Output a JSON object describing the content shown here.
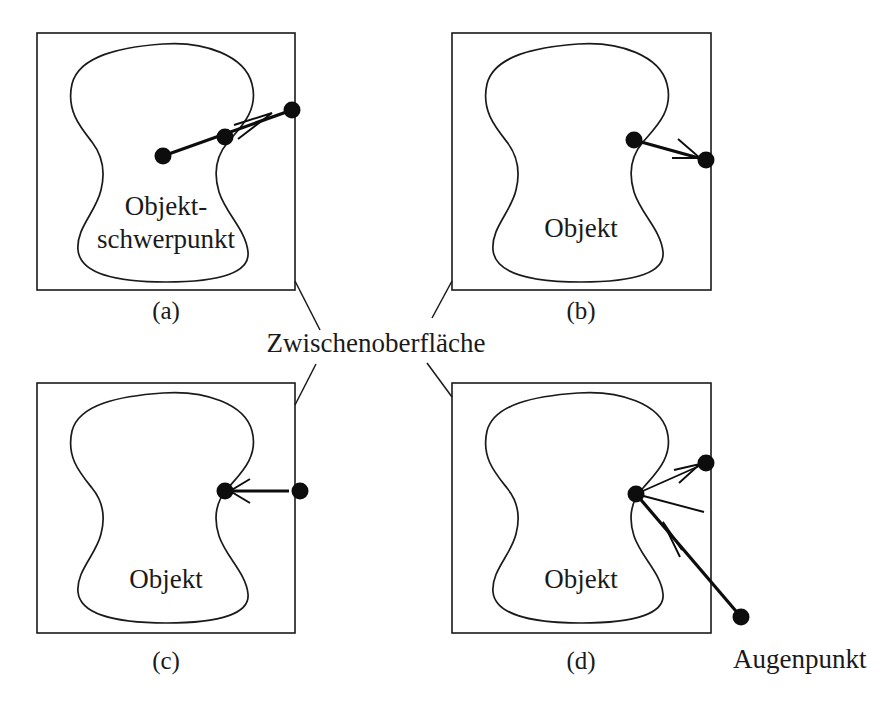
{
  "figure": {
    "caption_fragment_top": "",
    "callout_label": "Zwischenoberfläche",
    "eye_point_label": "Augenpunkt",
    "ink_color": "#1a1a1a",
    "background_color": "#ffffff"
  },
  "panels": [
    {
      "id": "a",
      "label": "(a)",
      "blob_label_line1": "Objekt-",
      "blob_label_line2": "schwerpunkt",
      "description": "Strahl vom Objektschwerpunkt durch Oberflächenpunkt nach außen"
    },
    {
      "id": "b",
      "label": "(b)",
      "blob_label_line1": "Objekt",
      "blob_label_line2": "",
      "description": "Strahl vom Oberflächenpunkt nach außen"
    },
    {
      "id": "c",
      "label": "(c)",
      "blob_label_line1": "Objekt",
      "blob_label_line2": "",
      "description": "Strahl von außen auf den Oberflächenpunkt"
    },
    {
      "id": "d",
      "label": "(d)",
      "blob_label_line1": "Objekt",
      "blob_label_line2": "",
      "description": "Mehrere Strahlen vom Oberflächenpunkt, Blickstrahl vom Augenpunkt"
    }
  ]
}
